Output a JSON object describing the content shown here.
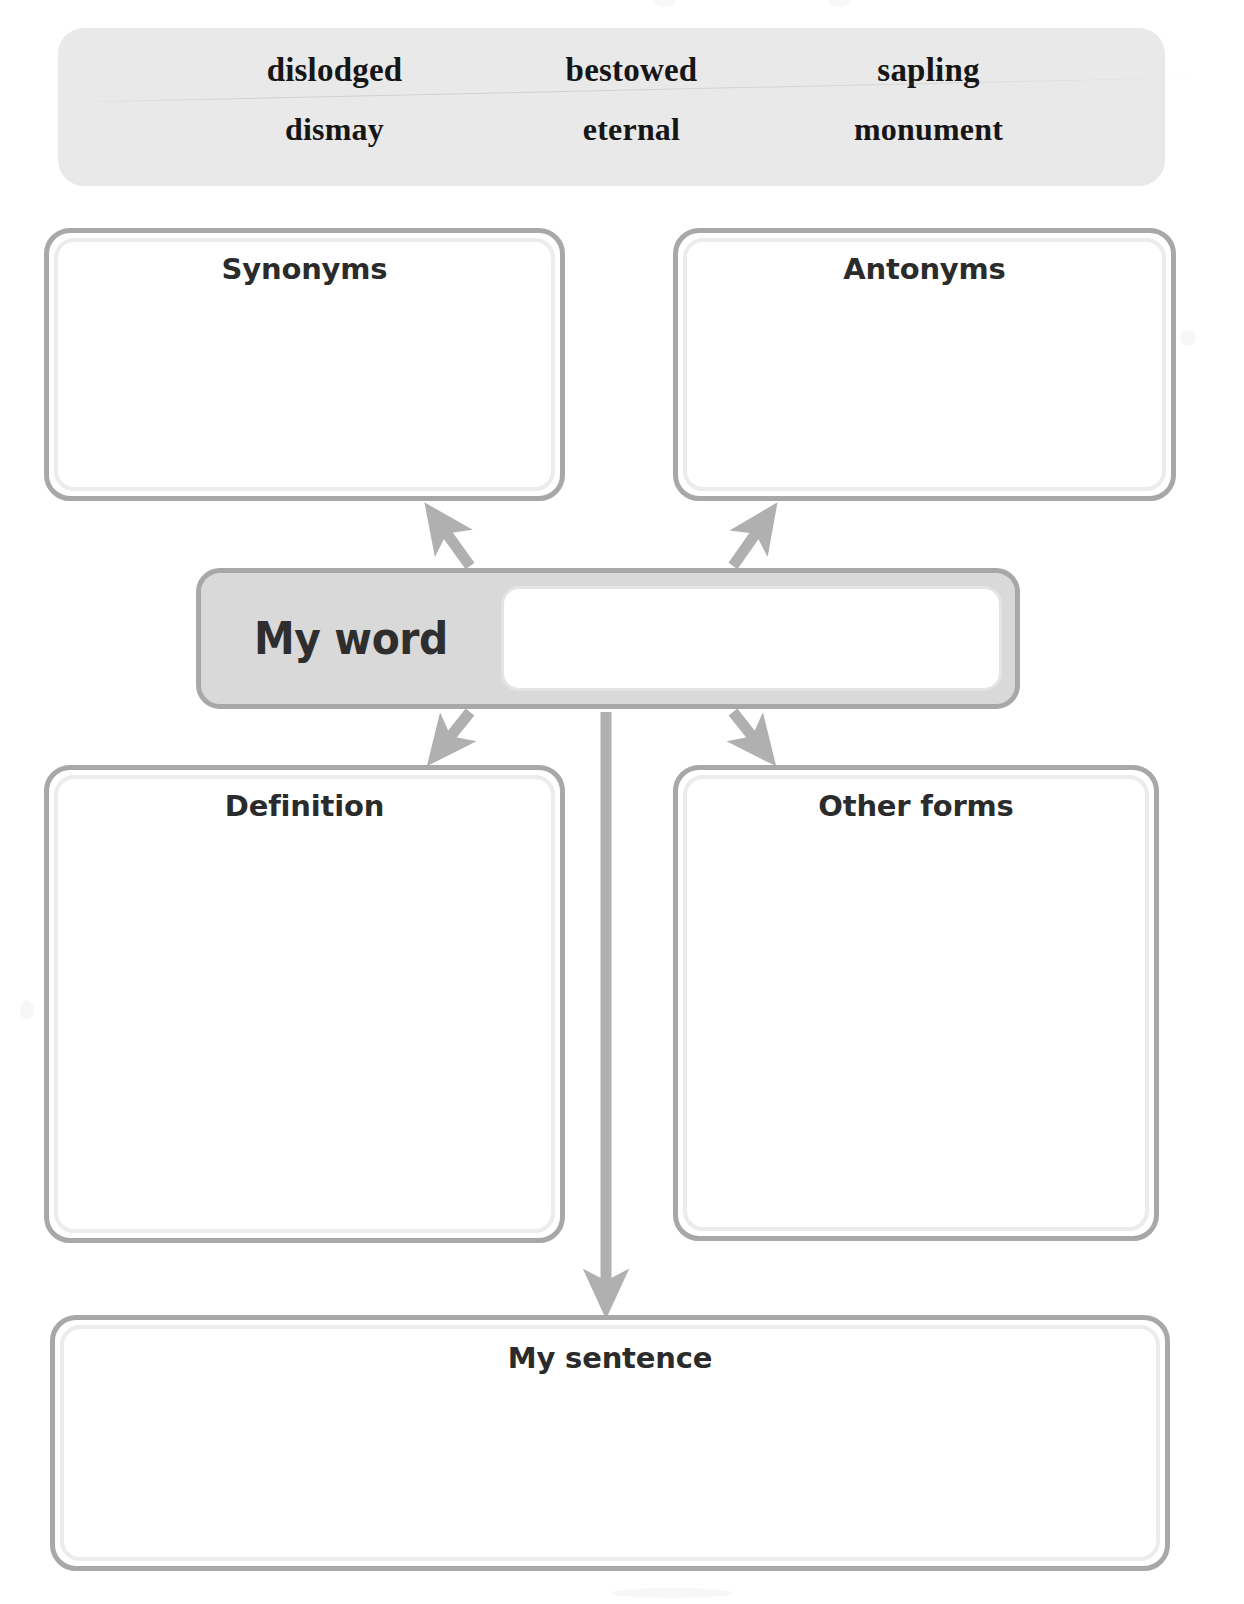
{
  "page": {
    "background_color": "#ffffff",
    "width": 1244,
    "height": 1604
  },
  "word_bank": {
    "background_color": "#e9e9e9",
    "rows": [
      [
        "dislodged",
        "bestowed",
        "sapling"
      ],
      [
        "dismay",
        "eternal",
        "monument"
      ]
    ],
    "words": [
      "dislodged",
      "bestowed",
      "sapling",
      "dismay",
      "eternal",
      "monument"
    ]
  },
  "organizer": {
    "center": {
      "label": "My word",
      "fill_color": "#d9d9d9",
      "border_color": "#a8a8a8",
      "input_value": ""
    },
    "boxes": [
      {
        "id": "synonyms",
        "label": "Synonyms",
        "value": ""
      },
      {
        "id": "antonyms",
        "label": "Antonyms",
        "value": ""
      },
      {
        "id": "definition",
        "label": "Definition",
        "value": ""
      },
      {
        "id": "otherforms",
        "label": "Other forms",
        "value": ""
      },
      {
        "id": "sentence",
        "label": "My sentence",
        "value": ""
      }
    ],
    "connectors": [
      {
        "from": "my-word",
        "to": "synonyms",
        "direction": "up-left"
      },
      {
        "from": "my-word",
        "to": "antonyms",
        "direction": "up-right"
      },
      {
        "from": "my-word",
        "to": "definition",
        "direction": "down-left"
      },
      {
        "from": "my-word",
        "to": "otherforms",
        "direction": "down-right"
      },
      {
        "from": "my-word",
        "to": "sentence",
        "direction": "down"
      }
    ],
    "arrow_color": "#b0b0b0",
    "box_border_color": "#a8a8a8",
    "box_fill_color": "#ffffff"
  }
}
